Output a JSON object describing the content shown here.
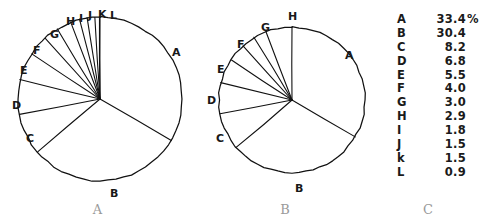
{
  "figure": {
    "background_color": "#ffffff",
    "ink_color": "#111111",
    "caption_color": "#9a9a9a"
  },
  "panels": [
    {
      "id": "a",
      "caption": "A"
    },
    {
      "id": "b",
      "caption": "B"
    },
    {
      "id": "c",
      "caption": "C"
    }
  ],
  "pie_a": {
    "caption": "A",
    "center": {
      "x": 100,
      "y": 99
    },
    "radius": 82,
    "rim_labels": [
      {
        "key": "A",
        "x": 172,
        "y": 47
      },
      {
        "key": "B",
        "x": 110,
        "y": 188
      },
      {
        "key": "C",
        "x": 26,
        "y": 133
      },
      {
        "key": "D",
        "x": 12,
        "y": 100
      },
      {
        "key": "E",
        "x": 20,
        "y": 65
      },
      {
        "key": "F",
        "x": 33,
        "y": 45
      },
      {
        "key": "G",
        "x": 50,
        "y": 29
      },
      {
        "key": "H",
        "x": 66,
        "y": 16
      },
      {
        "key": "I",
        "x": 79,
        "y": 13
      },
      {
        "key": "J",
        "x": 88,
        "y": 10
      },
      {
        "key": "K",
        "x": 98,
        "y": 9
      },
      {
        "key": "L",
        "x": 110,
        "y": 10
      }
    ]
  },
  "pie_b": {
    "caption": "B",
    "center": {
      "x": 97,
      "y": 100
    },
    "radius": 73,
    "rim_labels": [
      {
        "key": "A",
        "x": 150,
        "y": 50
      },
      {
        "key": "B",
        "x": 100,
        "y": 183
      },
      {
        "key": "C",
        "x": 21,
        "y": 133
      },
      {
        "key": "D",
        "x": 12,
        "y": 95
      },
      {
        "key": "E",
        "x": 22,
        "y": 64
      },
      {
        "key": "F",
        "x": 42,
        "y": 39
      },
      {
        "key": "G",
        "x": 66,
        "y": 22
      },
      {
        "key": "H",
        "x": 93,
        "y": 11
      }
    ]
  },
  "chart_data": {
    "type": "pie",
    "title": "",
    "units": "percent",
    "categories": [
      "A",
      "B",
      "C",
      "D",
      "E",
      "F",
      "G",
      "H",
      "I",
      "J",
      "K",
      "L"
    ],
    "values": [
      33.4,
      30.4,
      8.2,
      6.8,
      5.5,
      4.0,
      3.0,
      2.9,
      1.8,
      1.5,
      1.5,
      0.9
    ],
    "value_labels": [
      "33.4%",
      "30.4",
      "8.2",
      "6.8",
      "5.5",
      "4.0",
      "3.0",
      "2.9",
      "1.8",
      "1.5",
      "1.5",
      "0.9"
    ],
    "legend_position": "right",
    "legend_panel": "C",
    "start_angle_deg": 0,
    "direction": "clockwise",
    "charts": [
      {
        "panel": "A",
        "categories": [
          "A",
          "B",
          "C",
          "D",
          "E",
          "F",
          "G",
          "H",
          "I",
          "J",
          "K",
          "L"
        ],
        "values": [
          33.4,
          30.4,
          8.2,
          6.8,
          5.5,
          4.0,
          3.0,
          2.9,
          1.8,
          1.5,
          1.5,
          0.9
        ]
      },
      {
        "panel": "B",
        "categories": [
          "A",
          "B",
          "C",
          "D",
          "E",
          "F",
          "G",
          "H"
        ],
        "values": [
          33.4,
          30.4,
          8.2,
          6.8,
          5.5,
          4.0,
          3.0,
          2.9
        ]
      }
    ]
  },
  "legend": {
    "caption": "C",
    "rows": [
      {
        "key": "A",
        "value": "33.4",
        "suffix": "%"
      },
      {
        "key": "B",
        "value": "30.4",
        "suffix": ""
      },
      {
        "key": "C",
        "value": "8.2",
        "suffix": ""
      },
      {
        "key": "D",
        "value": "6.8",
        "suffix": ""
      },
      {
        "key": "E",
        "value": "5.5",
        "suffix": ""
      },
      {
        "key": "F",
        "value": "4.0",
        "suffix": ""
      },
      {
        "key": "G",
        "value": "3.0",
        "suffix": ""
      },
      {
        "key": "H",
        "value": "2.9",
        "suffix": ""
      },
      {
        "key": "I",
        "value": "1.8",
        "suffix": ""
      },
      {
        "key": "J",
        "value": "1.5",
        "suffix": ""
      },
      {
        "key": "k",
        "value": "1.5",
        "suffix": ""
      },
      {
        "key": "L",
        "value": "0.9",
        "suffix": ""
      }
    ]
  }
}
